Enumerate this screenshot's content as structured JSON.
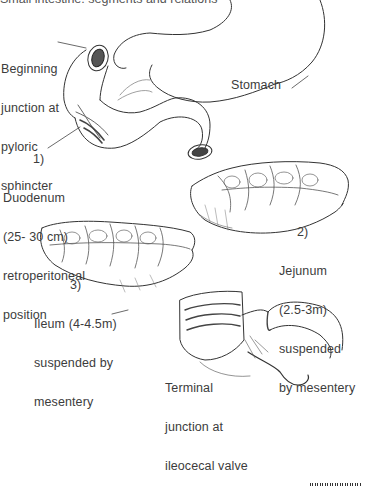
{
  "figure": {
    "title_partial": "Small intestine: segments and relations",
    "labels": {
      "beginning": [
        "Beginning",
        "junction at",
        "pyloric",
        "sphincter"
      ],
      "stomach": "Stomach",
      "duodenum": [
        "1)",
        "Duodenum",
        "(25- 30 cm)",
        "retroperitoneal",
        "position"
      ],
      "jejunum": [
        "2)",
        "Jejunum",
        "(2.5-3m)",
        "suspended",
        "by mesentery"
      ],
      "ileum": [
        "3)",
        "Ileum (4-4.5m)",
        "suspended by",
        "mesentery"
      ],
      "terminal": [
        "Terminal",
        "junction at",
        "ileocecal valve"
      ]
    },
    "segments": [
      {
        "number": "1)",
        "name": "Duodenum",
        "length": "25-30 cm",
        "note": "retroperitoneal position"
      },
      {
        "number": "2)",
        "name": "Jejunum",
        "length": "2.5-3m",
        "note": "suspended by mesentery"
      },
      {
        "number": "3)",
        "name": "Ileum",
        "length": "4-4.5m",
        "note": "suspended by mesentery"
      }
    ],
    "colors": {
      "ink": "#3a3a3a",
      "background": "#ffffff"
    }
  }
}
